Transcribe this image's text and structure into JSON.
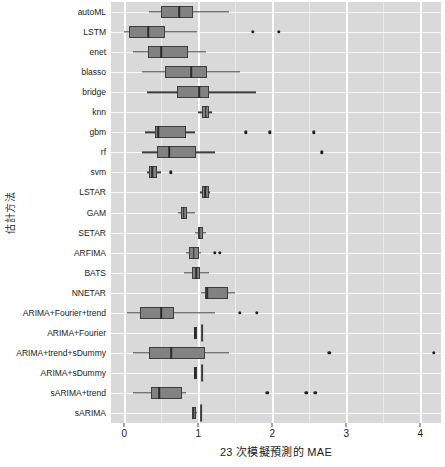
{
  "chart_data": {
    "type": "box",
    "title": "",
    "xlabel": "23 次模擬預測的 MAE",
    "ylabel": "估計方法",
    "xlim": [
      -0.18,
      4.28
    ],
    "xticks": [
      0,
      1,
      2,
      3,
      4
    ],
    "xticklabels": [
      "0",
      "1",
      "2",
      "3",
      "4"
    ],
    "grid": "major-white-on-grey-panel",
    "legend": "none",
    "orientation": "horizontal",
    "panel_background": "#d9d9d9",
    "box_fill": "#828282",
    "box_line": "#3d3d3d",
    "categories": [
      "autoML",
      "LSTM",
      "enet",
      "blasso",
      "bridge",
      "knn",
      "gbm",
      "rf",
      "svm",
      "LSTAR",
      "GAM",
      "SETAR",
      "ARFIMA",
      "BATS",
      "NNETAR",
      "ARIMA+Fourier+trend",
      "ARIMA+Fourier",
      "ARIMA+trend+sDummy",
      "ARIMA+sDummy",
      "sARIMA+trend",
      "sARIMA"
    ],
    "boxes": [
      {
        "category": "autoML",
        "min": 0.34,
        "q1": 0.5,
        "median": 0.74,
        "q3": 0.93,
        "max": 1.41,
        "outliers": []
      },
      {
        "category": "LSTM",
        "min": 0.0,
        "q1": 0.06,
        "median": 0.32,
        "q3": 0.55,
        "max": 0.98,
        "outliers": [
          1.74,
          2.09
        ]
      },
      {
        "category": "enet",
        "min": 0.12,
        "q1": 0.32,
        "median": 0.5,
        "q3": 0.86,
        "max": 1.1,
        "outliers": []
      },
      {
        "category": "blasso",
        "min": 0.24,
        "q1": 0.55,
        "median": 0.9,
        "q3": 1.12,
        "max": 1.56,
        "outliers": []
      },
      {
        "category": "bridge",
        "min": 0.31,
        "q1": 0.71,
        "median": 1.01,
        "q3": 1.14,
        "max": 1.78,
        "outliers": []
      },
      {
        "category": "knn",
        "min": 0.99,
        "q1": 1.05,
        "median": 1.1,
        "q3": 1.15,
        "max": 1.19,
        "outliers": []
      },
      {
        "category": "gbm",
        "min": 0.28,
        "q1": 0.42,
        "median": 0.46,
        "q3": 0.83,
        "max": 0.95,
        "outliers": [
          1.64,
          1.97,
          2.56
        ]
      },
      {
        "category": "rf",
        "min": 0.24,
        "q1": 0.44,
        "median": 0.61,
        "q3": 0.97,
        "max": 1.22,
        "outliers": [
          2.67
        ]
      },
      {
        "category": "svm",
        "min": 0.3,
        "q1": 0.33,
        "median": 0.38,
        "q3": 0.44,
        "max": 0.49,
        "outliers": [
          0.63
        ]
      },
      {
        "category": "LSTAR",
        "min": 1.02,
        "q1": 1.05,
        "median": 1.09,
        "q3": 1.14,
        "max": 1.16,
        "outliers": []
      },
      {
        "category": "GAM",
        "min": 0.73,
        "q1": 0.76,
        "median": 0.8,
        "q3": 0.85,
        "max": 0.96,
        "outliers": []
      },
      {
        "category": "SETAR",
        "min": 0.95,
        "q1": 0.99,
        "median": 1.02,
        "q3": 1.07,
        "max": 1.1,
        "outliers": []
      },
      {
        "category": "ARFIMA",
        "min": 0.84,
        "q1": 0.87,
        "median": 0.94,
        "q3": 1.01,
        "max": 1.03,
        "outliers": [
          1.22,
          1.29
        ]
      },
      {
        "category": "BATS",
        "min": 0.8,
        "q1": 0.92,
        "median": 0.97,
        "q3": 1.02,
        "max": 1.14,
        "outliers": []
      },
      {
        "category": "NNETAR",
        "min": 1.04,
        "q1": 1.09,
        "median": 1.12,
        "q3": 1.4,
        "max": 1.49,
        "outliers": []
      },
      {
        "category": "ARIMA+Fourier+trend",
        "min": 0.03,
        "q1": 0.21,
        "median": 0.5,
        "q3": 0.67,
        "max": 1.22,
        "outliers": [
          1.56,
          1.79
        ]
      },
      {
        "category": "ARIMA+Fourier",
        "min": 0.94,
        "q1": 0.94,
        "median": 0.96,
        "q3": 0.98,
        "max": 0.98,
        "outliers": []
      },
      {
        "category": "ARIMA+trend+sDummy",
        "min": 0.12,
        "q1": 0.33,
        "median": 0.63,
        "q3": 1.09,
        "max": 1.41,
        "outliers": [
          2.77,
          4.18
        ]
      },
      {
        "category": "ARIMA+sDummy",
        "min": 0.94,
        "q1": 0.94,
        "median": 0.96,
        "q3": 0.98,
        "max": 0.98,
        "outliers": []
      },
      {
        "category": "sARIMA+trend",
        "min": 0.12,
        "q1": 0.36,
        "median": 0.47,
        "q3": 0.78,
        "max": 0.84,
        "outliers": [
          1.93,
          2.46,
          2.58
        ]
      },
      {
        "category": "sARIMA",
        "min": 0.91,
        "q1": 0.92,
        "median": 0.94,
        "q3": 0.97,
        "max": 0.98,
        "outliers": []
      }
    ],
    "extra_vertical_marks": [
      {
        "category": "ARIMA+Fourier",
        "x": 1.05,
        "height_px": 17
      },
      {
        "category": "ARIMA+sDummy",
        "x": 1.05,
        "height_px": 17
      },
      {
        "category": "sARIMA",
        "x": 1.04,
        "height_px": 17
      }
    ]
  }
}
